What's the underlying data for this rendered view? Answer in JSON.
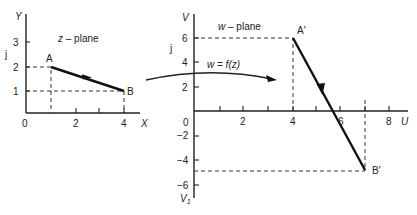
{
  "z_plane": {
    "title": "z – plane",
    "x_axis_label": "X",
    "y_axis_label": "Y",
    "imag_label": "j",
    "origin_label": "0",
    "x_ticks": [
      "2",
      "4"
    ],
    "y_ticks": [
      "1",
      "2",
      "3"
    ],
    "points": {
      "A": {
        "label": "A",
        "x": 1,
        "y": 2
      },
      "B": {
        "label": "B",
        "x": 4,
        "y": 1
      }
    }
  },
  "mapping": {
    "label": "w = f(z)"
  },
  "w_plane": {
    "title": "w – plane",
    "u_axis_label": "U",
    "v_axis_label": "V",
    "v_bottom_label": "V",
    "v_bottom_subscript": "1",
    "imag_label": "j",
    "origin_label": "0",
    "u_ticks": [
      "2",
      "4",
      "6",
      "8"
    ],
    "v_ticks_pos": [
      "2",
      "4",
      "6"
    ],
    "v_ticks_neg": [
      "−2",
      "−4",
      "−6"
    ],
    "points": {
      "A_prime": {
        "label": "A′",
        "u": 4,
        "v": 6
      },
      "B_prime": {
        "label": "B′",
        "u": 7,
        "v": -5
      }
    }
  }
}
